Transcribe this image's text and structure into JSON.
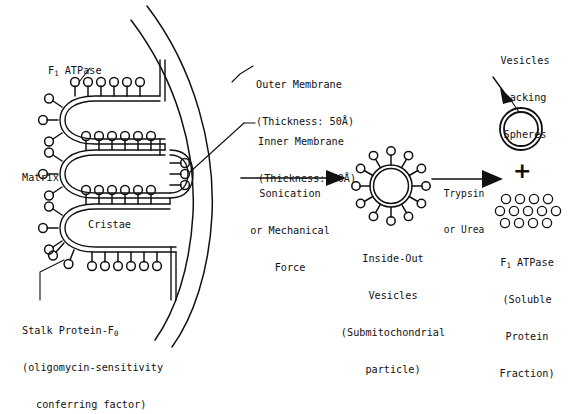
{
  "figure": {
    "type": "biology-diagram"
  },
  "labels": {
    "f1_atpase_left": {
      "main": "F",
      "sub": "1",
      "rest": " ATPase"
    },
    "matrix": "Matrix",
    "cristae": "Cristae",
    "outer_membrane_line1": "Outer Membrane",
    "outer_membrane_line2": "(Thickness: 50Å)",
    "inner_membrane_line1": "Inner Membrane",
    "inner_membrane_line2": "(Thickness: 50Å)",
    "stalk_protein_line1_a": "Stalk Protein-F",
    "stalk_protein_line1_sub": "0",
    "stalk_protein_line2": "(oligomycin-sensitivity",
    "stalk_protein_line3": "conferring factor)"
  },
  "arrows": {
    "first": {
      "line1": "Sonication",
      "line2": "or Mechanical",
      "line3": "Force"
    },
    "second": {
      "line1": "Trypsin",
      "line2": "or Urea"
    },
    "plus_sign": "+"
  },
  "products": {
    "vesicle_caption": {
      "line1": "Inside-Out",
      "line2": "Vesicles",
      "line3": "(Submitochondrial",
      "line4": "particle)"
    },
    "vesicles_lacking": {
      "line1": "Vesicles",
      "line2": "Lacking",
      "line3": "Spheres"
    },
    "soluble_f1": {
      "line1_a": "F",
      "line1_sub": "1",
      "line1_b": " ATPase",
      "line2": "(Soluble",
      "line3": "Protein",
      "line4": "Fraction)"
    }
  },
  "colors": {
    "ink": "#111111",
    "background": "#ffffff"
  },
  "counts": {
    "vesicle_spheres": 12,
    "free_sphere_rows": [
      4,
      5,
      4
    ]
  }
}
